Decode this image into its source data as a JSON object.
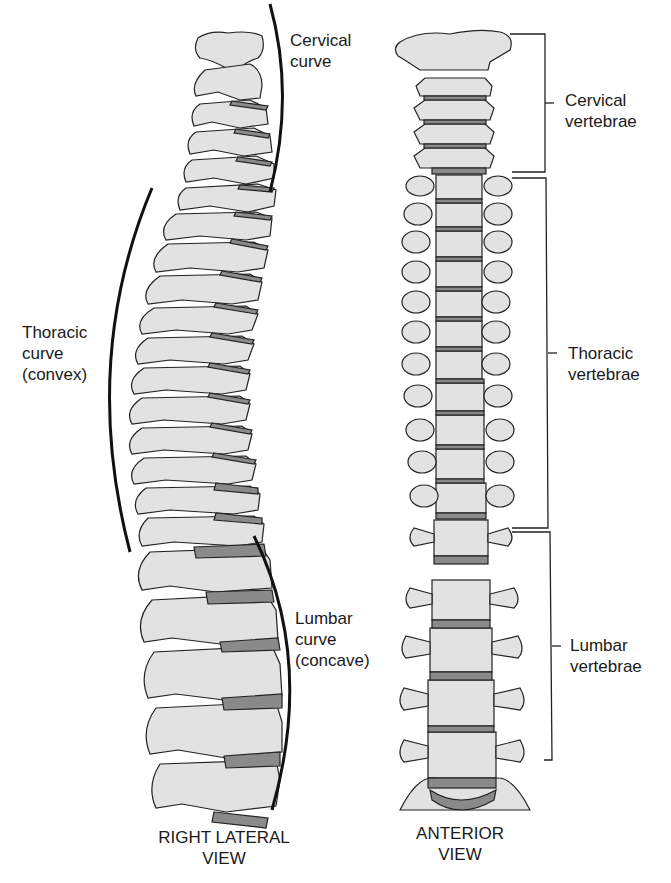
{
  "diagram": {
    "colors": {
      "bone_fill": "#e2e2e2",
      "disc_fill": "#8a8a8a",
      "outline": "#222222",
      "text": "#1a1a1a"
    },
    "lateral_view": {
      "caption_line1": "RIGHT LATERAL",
      "caption_line2": "VIEW",
      "labels": {
        "cervical": {
          "line1": "Cervical",
          "line2": "curve"
        },
        "thoracic": {
          "line1": "Thoracic",
          "line2": "curve",
          "line3": "(convex)"
        },
        "lumbar": {
          "line1": "Lumbar",
          "line2": "curve",
          "line3": "(concave)"
        }
      }
    },
    "anterior_view": {
      "caption_line1": "ANTERIOR",
      "caption_line2": "VIEW",
      "labels": {
        "cervical": {
          "line1": "Cervical",
          "line2": "vertebrae"
        },
        "thoracic": {
          "line1": "Thoracic",
          "line2": "vertebrae"
        },
        "lumbar": {
          "line1": "Lumbar",
          "line2": "vertebrae"
        }
      }
    }
  }
}
